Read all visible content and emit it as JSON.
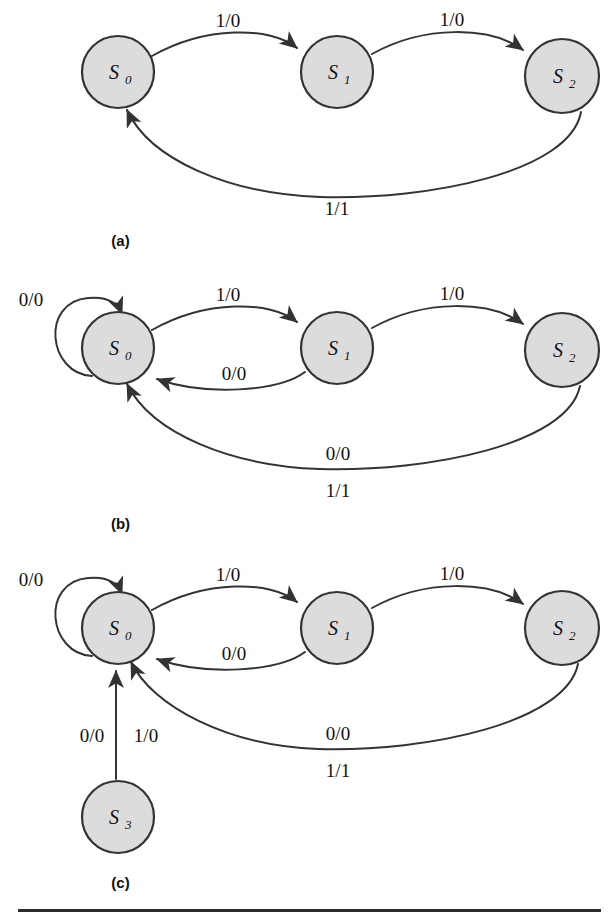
{
  "figure": {
    "type": "state-transition-diagram-set",
    "panels": [
      {
        "id": "a",
        "caption": "(a)",
        "states": [
          {
            "id": "S0",
            "label": "S",
            "subscript": "0"
          },
          {
            "id": "S1",
            "label": "S",
            "subscript": "1"
          },
          {
            "id": "S2",
            "label": "S",
            "subscript": "2"
          }
        ],
        "transitions": [
          {
            "from": "S0",
            "to": "S1",
            "label": "1/0"
          },
          {
            "from": "S1",
            "to": "S2",
            "label": "1/0"
          },
          {
            "from": "S2",
            "to": "S0",
            "label": "1/1"
          }
        ]
      },
      {
        "id": "b",
        "caption": "(b)",
        "states": [
          {
            "id": "S0",
            "label": "S",
            "subscript": "0"
          },
          {
            "id": "S1",
            "label": "S",
            "subscript": "1"
          },
          {
            "id": "S2",
            "label": "S",
            "subscript": "2"
          }
        ],
        "transitions": [
          {
            "from": "S0",
            "to": "S0",
            "label": "0/0"
          },
          {
            "from": "S0",
            "to": "S1",
            "label": "1/0"
          },
          {
            "from": "S1",
            "to": "S0",
            "label": "0/0"
          },
          {
            "from": "S1",
            "to": "S2",
            "label": "1/0"
          },
          {
            "from": "S2",
            "to": "S0",
            "label": "0/0"
          },
          {
            "from": "S2",
            "to": "S0",
            "label": "1/1"
          }
        ]
      },
      {
        "id": "c",
        "caption": "(c)",
        "states": [
          {
            "id": "S0",
            "label": "S",
            "subscript": "0"
          },
          {
            "id": "S1",
            "label": "S",
            "subscript": "1"
          },
          {
            "id": "S2",
            "label": "S",
            "subscript": "2"
          },
          {
            "id": "S3",
            "label": "S",
            "subscript": "3"
          }
        ],
        "transitions": [
          {
            "from": "S0",
            "to": "S0",
            "label": "0/0"
          },
          {
            "from": "S0",
            "to": "S1",
            "label": "1/0"
          },
          {
            "from": "S1",
            "to": "S0",
            "label": "0/0"
          },
          {
            "from": "S1",
            "to": "S2",
            "label": "1/0"
          },
          {
            "from": "S2",
            "to": "S0",
            "label": "0/0"
          },
          {
            "from": "S2",
            "to": "S0",
            "label": "1/1"
          },
          {
            "from": "S3",
            "to": "S0",
            "label": "0/0"
          },
          {
            "from": "S3",
            "to": "S0",
            "label": "1/0"
          }
        ]
      }
    ],
    "labels": {
      "a_s0": "S",
      "a_s0_sub": "0",
      "a_s1": "S",
      "a_s1_sub": "1",
      "a_s2": "S",
      "a_s2_sub": "2",
      "a_e1": "1/0",
      "a_e2": "1/0",
      "a_e3": "1/1",
      "a_caption": "(a)",
      "b_s0": "S",
      "b_s0_sub": "0",
      "b_s1": "S",
      "b_s1_sub": "1",
      "b_s2": "S",
      "b_s2_sub": "2",
      "b_loop": "0/0",
      "b_e1": "1/0",
      "b_e2": "0/0",
      "b_e3": "1/0",
      "b_e4": "0/0",
      "b_e5": "1/1",
      "b_caption": "(b)",
      "c_s0": "S",
      "c_s0_sub": "0",
      "c_s1": "S",
      "c_s1_sub": "1",
      "c_s2": "S",
      "c_s2_sub": "2",
      "c_s3": "S",
      "c_s3_sub": "3",
      "c_loop": "0/0",
      "c_e1": "1/0",
      "c_e2": "0/0",
      "c_e3": "1/0",
      "c_e4": "0/0",
      "c_e5": "1/1",
      "c_e6": "0/0",
      "c_e7": "1/0",
      "c_caption": "(c)"
    }
  },
  "colors": {
    "node_fill": "#dcdcdc",
    "stroke": "#333333",
    "text": "#111111",
    "rule": "#2b2b2b",
    "background": "#ffffff"
  }
}
